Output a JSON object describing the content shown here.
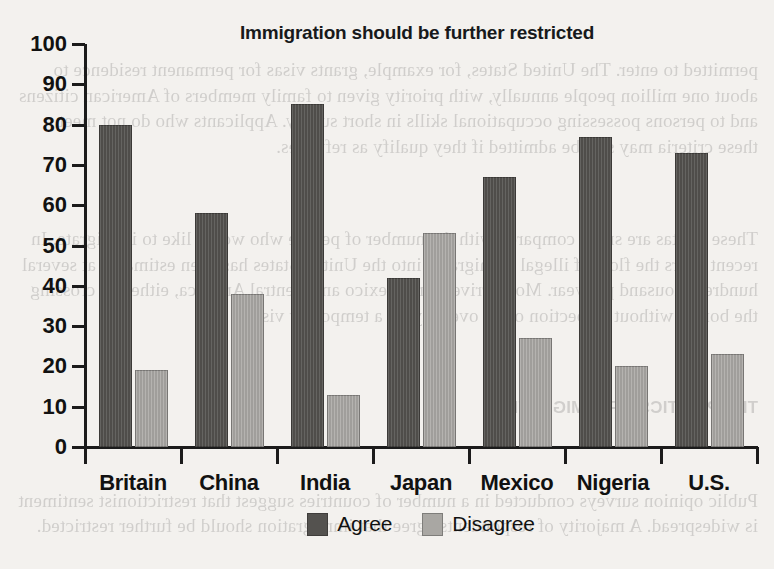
{
  "chart_data": {
    "type": "bar",
    "title": "Immigration should be further restricted",
    "xlabel": "",
    "ylabel": "",
    "ylim": [
      0,
      100
    ],
    "yticks": [
      0,
      10,
      20,
      30,
      40,
      50,
      60,
      70,
      80,
      90,
      100
    ],
    "grid": false,
    "legend_position": "bottom-center",
    "categories": [
      "Britain",
      "China",
      "India",
      "Japan",
      "Mexico",
      "Nigeria",
      "U.S."
    ],
    "series": [
      {
        "name": "Agree",
        "color": "#54524f",
        "values": [
          80,
          58,
          85,
          42,
          67,
          77,
          73
        ]
      },
      {
        "name": "Disagree",
        "color": "#a9a7a3",
        "values": [
          19,
          38,
          13,
          53,
          27,
          20,
          23
        ]
      }
    ]
  },
  "background_text": {
    "block1": "permitted to enter. The United States, for example, grants visas for permanent residence to about one million people annually, with priority given to family members of American citizens and to persons possessing occupational skills in short supply. Applicants who do not meet these criteria may still be admitted if they qualify as refugees.",
    "block2": "These quotas are small compared with the number of people who would like to immigrate. In recent years the flow of illegal immigrants into the United States has been estimated at several hundred thousand per year. Most arrive from Mexico and Central America, either by crossing the border without inspection or by overstaying a temporary visa.",
    "heading": "THE POLITICS OF IMMIGRATION",
    "block3": "Public opinion surveys conducted in a number of countries suggest that restrictionist sentiment is widespread. A majority of respondents agree that immigration should be further restricted."
  }
}
